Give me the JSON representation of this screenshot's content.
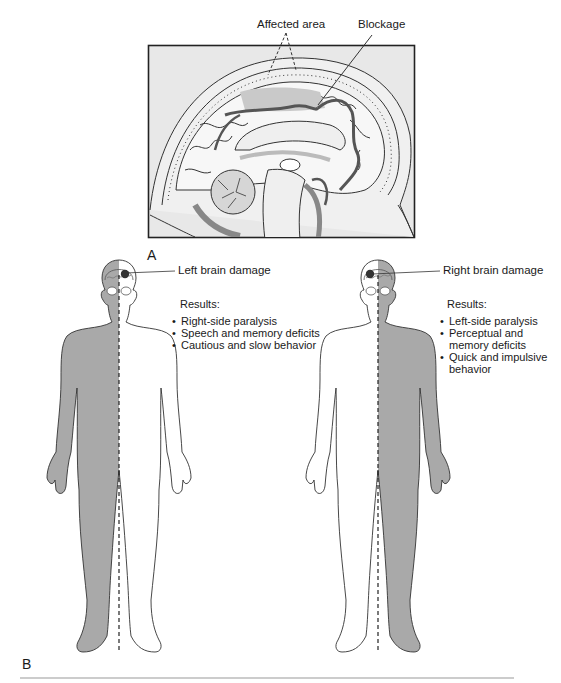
{
  "panel_a": {
    "letter": "A",
    "labels": {
      "affected_area": "Affected area",
      "blockage": "Blockage"
    },
    "colors": {
      "frame_bg": "#e6e6e6",
      "frame_border": "#222222",
      "tissue_shade": "#8c8c8c"
    }
  },
  "panel_b": {
    "letter": "B",
    "left_figure": {
      "callout": "Left brain damage",
      "results_heading": "Results:",
      "results": [
        "Right-side paralysis",
        "Speech and memory deficits",
        "Cautious and slow behavior"
      ],
      "shaded_side": "body right (viewer left)"
    },
    "right_figure": {
      "callout": "Right brain damage",
      "results_heading": "Results:",
      "results": [
        "Left-side paralysis",
        "Perceptual and memory deficits",
        "Quick and impulsive behavior"
      ],
      "results_display": [
        "Left-side paralysis",
        "Perceptual and",
        "memory deficits",
        "Quick and impulsive",
        "behavior"
      ],
      "shaded_side": "body left (viewer right)"
    },
    "colors": {
      "shade": "#a9a9a9",
      "outline": "#333333",
      "lesion": "#333333"
    }
  }
}
